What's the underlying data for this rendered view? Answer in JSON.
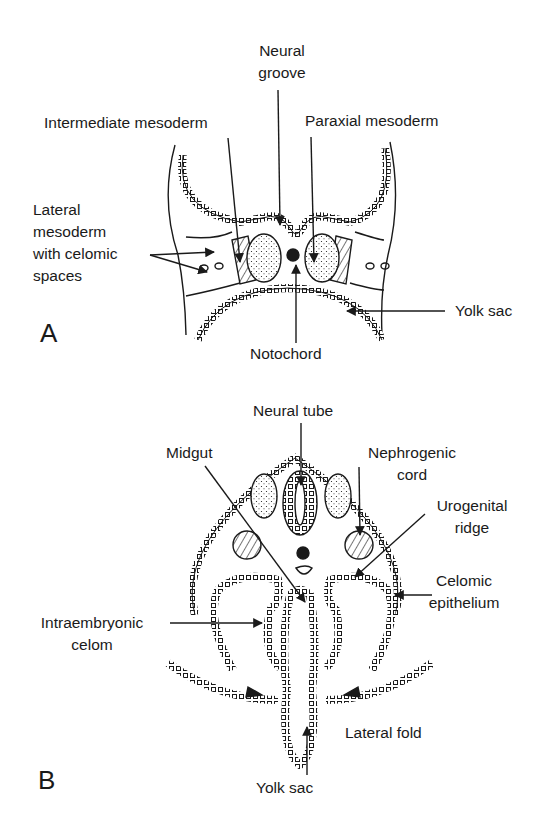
{
  "panels": [
    {
      "id": "A",
      "letter": "A",
      "labels": {
        "neural_groove": "Neural\ngroove",
        "intermediate_mesoderm": "Intermediate mesoderm",
        "paraxial_mesoderm": "Paraxial mesoderm",
        "lateral_mesoderm": "Lateral\nmesoderm\nwith celomic\nspaces",
        "yolk_sac": "Yolk sac",
        "notochord": "Notochord"
      }
    },
    {
      "id": "B",
      "letter": "B",
      "labels": {
        "neural_tube": "Neural tube",
        "midgut": "Midgut",
        "nephrogenic_cord": "Nephrogenic\ncord",
        "urogenital_ridge": "Urogenital\nridge",
        "celomic_epithelium": "Celomic\nepithelium",
        "intraembryonic_celom": "Intraembryonic\ncelom",
        "lateral_fold": "Lateral fold",
        "yolk_sac": "Yolk sac"
      }
    }
  ],
  "colors": {
    "ink": "#1a1a1a",
    "background": "#ffffff"
  }
}
